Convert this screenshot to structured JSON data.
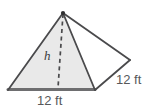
{
  "figure": {
    "name": "square-pyramid-diagram",
    "colors": {
      "front_face_fill": "#e6e6e6",
      "left_face_fill": "#ededed",
      "right_face_fill": "#ffffff",
      "edge_stroke": "#4a4a4c",
      "base_stroke": "#6e6e70",
      "label_text": "#58585a",
      "height_text": "#3a3a3c",
      "background": "#ffffff"
    },
    "labels": {
      "height": "h",
      "base_edge": "12 ft",
      "slant_edge": "12 ft"
    },
    "geometry": {
      "apex": [
        63,
        13
      ],
      "base_front_left": [
        8,
        90
      ],
      "base_front_right": [
        95,
        90
      ],
      "base_right": [
        130,
        60
      ],
      "height_foot": [
        58,
        88
      ]
    }
  }
}
